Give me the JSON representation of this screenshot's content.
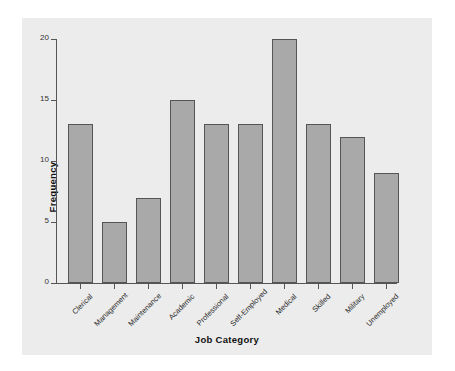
{
  "chart_data": {
    "type": "bar",
    "title": "",
    "xlabel": "Job Category",
    "ylabel": "Frequency",
    "categories": [
      "Clerical",
      "Management",
      "Maintenance",
      "Academic",
      "Professional",
      "Self-Employed",
      "Medical",
      "Skilled",
      "Military",
      "Unemployed"
    ],
    "values": [
      13,
      5,
      7,
      15,
      13,
      13,
      20,
      13,
      12,
      9
    ],
    "ylim": [
      0,
      20
    ],
    "yticks": [
      0,
      5,
      10,
      15,
      20
    ],
    "ytick_labels": [
      "0",
      "5",
      "10",
      "15",
      "20"
    ],
    "grid": false,
    "legend": null,
    "xtick_rotation": 45,
    "colors": {
      "bar_fill": "#a9a9a9",
      "bar_edge": "#555555",
      "panel_background": "#ececec",
      "figure_background": "#ffffff",
      "axis": "#555555",
      "text": "#111111"
    }
  }
}
